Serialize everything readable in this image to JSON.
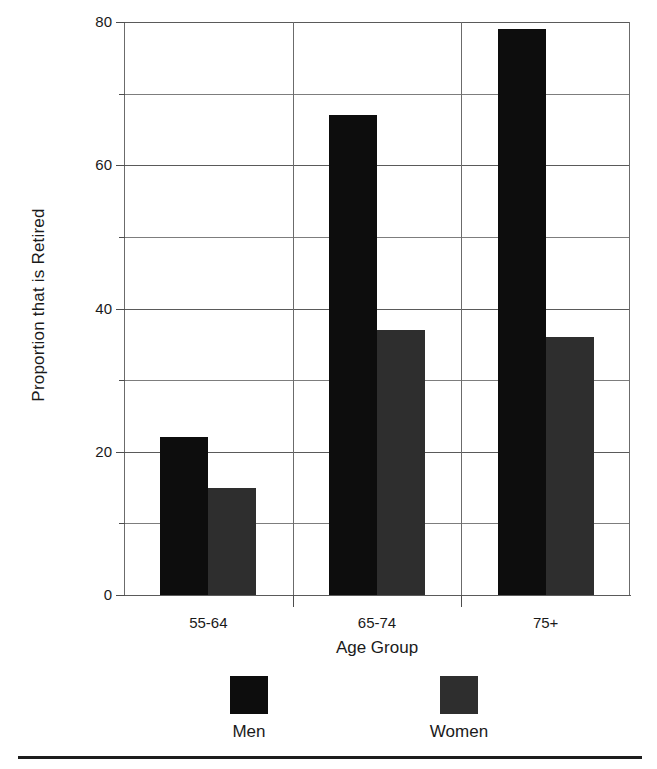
{
  "chart_data": {
    "type": "bar",
    "title": "",
    "xlabel": "Age Group",
    "ylabel": "Proportion that is Retired",
    "categories": [
      "55-64",
      "65-74",
      "75+"
    ],
    "series": [
      {
        "name": "Men",
        "values": [
          22,
          67,
          79
        ],
        "color": "#0d0d0d"
      },
      {
        "name": "Women",
        "values": [
          15,
          37,
          36
        ],
        "color": "#2e2e2e"
      }
    ],
    "ylim": [
      0,
      80
    ],
    "yticks": [
      0,
      20,
      40,
      60,
      80
    ],
    "ytick_labels": [
      "0",
      "20",
      "40",
      "60",
      "80"
    ],
    "minor_yticks": [
      10,
      30,
      50,
      70
    ],
    "grid": true,
    "grid_axis": "y",
    "legend_position": "bottom",
    "legend_entries": [
      "Men",
      "Women"
    ]
  },
  "axes": {
    "y_title": "Proportion that is Retired",
    "x_title": "Age Group"
  },
  "colors": {
    "men": "#0d0d0d",
    "women": "#2e2e2e",
    "grid": "#6b6b6b",
    "axis": "#5a5a5a",
    "text": "#1a1a1a",
    "background": "#ffffff",
    "rule": "#1d1d1d"
  }
}
